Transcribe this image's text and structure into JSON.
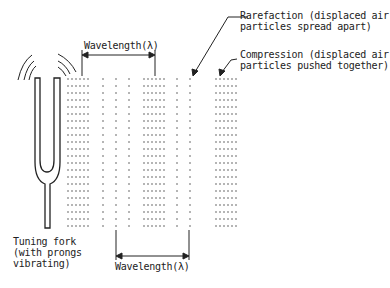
{
  "diagram": {
    "labels": {
      "wavelength_top": "Wavelength(λ)",
      "wavelength_bottom": "Wavelength(λ)",
      "rarefaction_line1": "Rarefaction (displaced air",
      "rarefaction_line2": "particles spread apart)",
      "compression_line1": "Compression (displaced air",
      "compression_line2": "particles pushed together)",
      "fork_line1": "Tuning fork",
      "fork_line2": "(with prongs",
      "fork_line3": "vibrating)"
    },
    "icons": [
      "tuning-fork-icon",
      "vibration-arcs-icon",
      "arrow-icon"
    ],
    "colors": {
      "ink": "#222222",
      "background": "#ffffff"
    }
  }
}
